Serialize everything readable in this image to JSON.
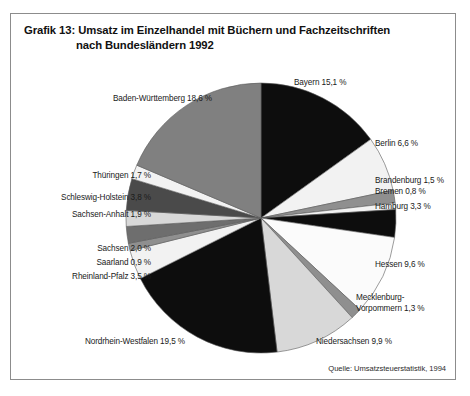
{
  "figure": {
    "title_line1": "Grafik 13: Umsatz im Einzelhandel mit Büchern und Fachzeitschriften",
    "title_line2": "nach Bundesländern 1992",
    "source": "Quelle: Umsatzsteuerstatistik, 1994",
    "border_color": "#8c8c8c",
    "background": "#ffffff"
  },
  "chart_data": {
    "type": "pie",
    "subtitle": "",
    "xlabel": "",
    "ylabel": "",
    "unit": "%",
    "legend_position": "none",
    "labels_position": "outside-callout",
    "grid": false,
    "start_angle_deg": 0,
    "direction": "clockwise",
    "categories": [
      "Bayern",
      "Berlin",
      "Brandenburg",
      "Bremen",
      "Hamburg",
      "Hessen",
      "Mecklenburg-Vorpommern",
      "Niedersachsen",
      "Nordrhein-Westfalen",
      "Rheinland-Pfalz",
      "Saarland",
      "Sachsen",
      "Sachsen-Anhalt",
      "Schleswig-Holstein",
      "Thüringen",
      "Baden-Württemberg"
    ],
    "values": [
      15.1,
      6.6,
      1.5,
      0.8,
      3.3,
      9.6,
      1.3,
      9.9,
      19.5,
      3.5,
      0.9,
      2.0,
      1.9,
      3.8,
      1.7,
      18.6
    ],
    "slices": [
      {
        "name": "Bayern",
        "value": 15.1,
        "label": "Bayern 15,1 %",
        "color": "#0d0d0d"
      },
      {
        "name": "Berlin",
        "value": 6.6,
        "label": "Berlin 6,6 %",
        "color": "#f2f2f2"
      },
      {
        "name": "Brandenburg",
        "value": 1.5,
        "label": "Brandenburg 1,5 %",
        "color": "#8f8f8f"
      },
      {
        "name": "Bremen",
        "value": 0.8,
        "label": "Bremen 0,8 %",
        "color": "#f2f2f2"
      },
      {
        "name": "Hamburg",
        "value": 3.3,
        "label": "Hamburg 3,3 %",
        "color": "#0d0d0d"
      },
      {
        "name": "Hessen",
        "value": 9.6,
        "label": "Hessen 9,6 %",
        "color": "#fbfbfb"
      },
      {
        "name": "Mecklenburg-Vorpommern",
        "value": 1.3,
        "label": "Mecklenburg-\nVorpommern 1,3 %",
        "color": "#8f8f8f"
      },
      {
        "name": "Niedersachsen",
        "value": 9.9,
        "label": "Niedersachsen 9,9 %",
        "color": "#d8d8d8"
      },
      {
        "name": "Nordrhein-Westfalen",
        "value": 19.5,
        "label": "Nordrhein-Westfalen 19,5 %",
        "color": "#0d0d0d"
      },
      {
        "name": "Rheinland-Pfalz",
        "value": 3.5,
        "label": "Rheinland-Pfalz 3,5 %",
        "color": "#f2f2f2"
      },
      {
        "name": "Saarland",
        "value": 0.9,
        "label": "Saarland 0,9 %",
        "color": "#8f8f8f"
      },
      {
        "name": "Sachsen",
        "value": 2.0,
        "label": "Sachsen 2,0 %",
        "color": "#6e6e6e"
      },
      {
        "name": "Sachsen-Anhalt",
        "value": 1.9,
        "label": "Sachsen-Anhalt 1,9 %",
        "color": "#d8d8d8"
      },
      {
        "name": "Schleswig-Holstein",
        "value": 3.8,
        "label": "Schleswig-Holstein 3,8 %",
        "color": "#4a4a4a"
      },
      {
        "name": "Thüringen",
        "value": 1.7,
        "label": "Thüringen 1,7 %",
        "color": "#f2f2f2"
      },
      {
        "name": "Baden-Württemberg",
        "value": 18.6,
        "label": "Baden-Württemberg 18,6 %",
        "color": "#808080"
      }
    ]
  },
  "labels": {
    "bayern": {
      "text": "Bayern 15,1 %",
      "x": 283,
      "y": 68,
      "align": "left"
    },
    "berlin": {
      "text": "Berlin 6,6 %",
      "x": 364,
      "y": 129,
      "align": "left"
    },
    "brandenburg": {
      "text": "Brandenburg 1,5 %",
      "x": 364,
      "y": 166,
      "align": "left"
    },
    "bremen": {
      "text": "Bremen 0,8 %",
      "x": 364,
      "y": 177,
      "align": "left"
    },
    "hamburg": {
      "text": "Hamburg 3,3 %",
      "x": 364,
      "y": 192,
      "align": "left"
    },
    "hessen": {
      "text": "Hessen 9,6 %",
      "x": 364,
      "y": 250,
      "align": "left"
    },
    "mecklenburg": {
      "text": "Mecklenburg-\nVorpommern 1,3 %",
      "x": 345,
      "y": 287,
      "align": "left"
    },
    "niedersachsen": {
      "text": "Niedersachsen 9,9 %",
      "x": 305,
      "y": 327,
      "align": "left"
    },
    "nordrhein": {
      "text": "Nordrhein-Westfalen 19,5 %",
      "x": 174,
      "y": 327,
      "align": "right"
    },
    "rheinland": {
      "text": "Rheinland-Pfalz 3,5 %",
      "x": 140,
      "y": 262,
      "align": "right"
    },
    "saarland": {
      "text": "Saarland 0,9 %",
      "x": 140,
      "y": 248,
      "align": "right"
    },
    "sachsen": {
      "text": "Sachsen 2,0 %",
      "x": 140,
      "y": 234,
      "align": "right"
    },
    "sachsen_anhalt": {
      "text": "Sachsen-Anhalt 1,9 %",
      "x": 140,
      "y": 200,
      "align": "right"
    },
    "schleswig": {
      "text": "Schleswig-Holstein 3,8 %",
      "x": 140,
      "y": 183,
      "align": "right"
    },
    "thueringen": {
      "text": "Thüringen 1,7 %",
      "x": 140,
      "y": 161,
      "align": "right"
    },
    "baden": {
      "text": "Baden-Württemberg 18,6 %",
      "x": 201,
      "y": 84,
      "align": "right"
    }
  }
}
